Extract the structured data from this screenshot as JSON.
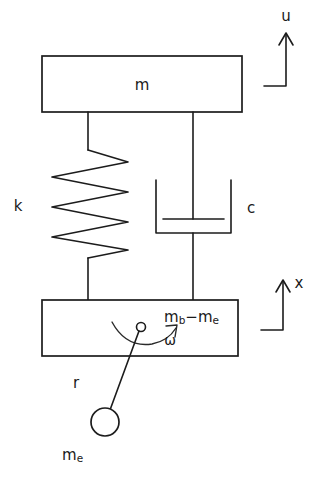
{
  "diagram": {
    "type": "mechanical-schematic",
    "background_color": "#ffffff",
    "line_color": "#1c1c1c",
    "labels": {
      "upper_mass": "m",
      "spring": "k",
      "damper": "c",
      "housing_mass_base": "m",
      "housing_mass_sub_b": "b",
      "housing_minus": "−",
      "housing_mass_base2": "m",
      "housing_mass_sub_e": "e",
      "angular_velocity": "ω",
      "radius": "r",
      "eccentric_mass_base": "m",
      "eccentric_mass_sub": "e",
      "displacement_upper": "u",
      "displacement_lower": "x"
    },
    "components": [
      {
        "name": "upper-mass-block",
        "label": "m",
        "shape": "rectangle"
      },
      {
        "name": "spring",
        "label": "k",
        "shape": "zigzag",
        "coils": 4
      },
      {
        "name": "damper",
        "label": "c",
        "shape": "dashpot"
      },
      {
        "name": "housing-block",
        "label": "m_b − m_e",
        "shape": "rectangle"
      },
      {
        "name": "eccentric-mass",
        "label": "m_e",
        "shape": "circle"
      },
      {
        "name": "rotating-arm",
        "label": "r",
        "shape": "line"
      },
      {
        "name": "rotation-arrow",
        "label": "ω",
        "shape": "curved-arrow"
      },
      {
        "name": "displacement-arrow-u",
        "label": "u",
        "shape": "arrow-up"
      },
      {
        "name": "displacement-arrow-x",
        "label": "x",
        "shape": "arrow-up"
      }
    ]
  }
}
